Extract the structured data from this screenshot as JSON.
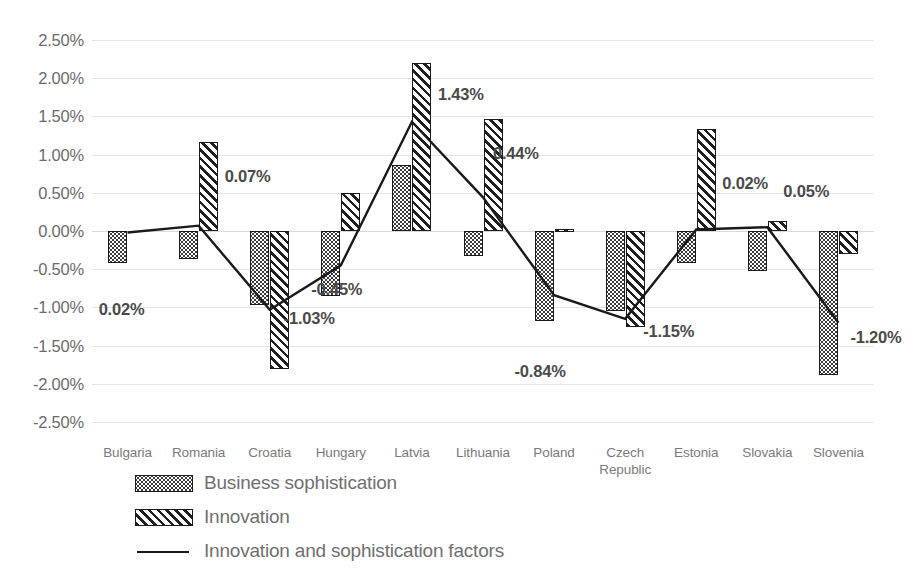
{
  "chart_data": {
    "type": "bar",
    "title": "",
    "xlabel": "",
    "ylabel": "",
    "ylim": [
      -2.5,
      2.5
    ],
    "ytick_step": 0.5,
    "grid": true,
    "legend_position": "bottom-left",
    "value_suffix": "%",
    "categories": [
      "Bulgaria",
      "Romania",
      "Croatia",
      "Hungary",
      "Latvia",
      "Lithuania",
      "Poland",
      "Czech Republic",
      "Estonia",
      "Slovakia",
      "Slovenia"
    ],
    "ytick_labels": [
      "2.50%",
      "2.00%",
      "1.50%",
      "1.00%",
      "0.50%",
      "0.00%",
      "-0.50%",
      "-1.00%",
      "-1.50%",
      "-2.00%",
      "-2.50%"
    ],
    "ytick_values": [
      2.5,
      2.0,
      1.5,
      1.0,
      0.5,
      0.0,
      -0.5,
      -1.0,
      -1.5,
      -2.0,
      -2.5
    ],
    "series": [
      {
        "name": "Business sophistication",
        "type": "bar",
        "pattern": "dotted",
        "values": [
          -0.42,
          -0.37,
          -0.97,
          -0.85,
          0.87,
          -0.33,
          -1.18,
          -1.05,
          -0.42,
          -0.52,
          -1.88
        ]
      },
      {
        "name": "Innovation",
        "type": "bar",
        "pattern": "diagonal-hatch",
        "values": [
          null,
          1.17,
          -1.8,
          0.5,
          2.2,
          1.47,
          0.03,
          -1.25,
          1.33,
          0.13,
          -0.3
        ]
      },
      {
        "name": "Innovation and sophistication factors",
        "type": "line",
        "pattern": "solid-line",
        "values": [
          -0.02,
          0.07,
          -1.03,
          -0.45,
          1.43,
          0.44,
          -0.84,
          -1.15,
          0.02,
          0.05,
          -1.2
        ],
        "point_labels": [
          "0.02%",
          "0.07%",
          "-1.03%",
          "-0.45%",
          "1.43%",
          "0.44%",
          "-0.84%",
          "-1.15%",
          "0.02%",
          "0.05%",
          "-1.20%"
        ]
      }
    ]
  },
  "legend": {
    "items": [
      {
        "label": "Business sophistication",
        "swatch": "dotted-swatch"
      },
      {
        "label": "Innovation",
        "swatch": "hatch-swatch"
      },
      {
        "label": "Innovation and sophistication factors",
        "swatch": "line-swatch"
      }
    ]
  },
  "colors": {
    "grid": "#e4e4e4",
    "bar_outline": "#1a1a1a",
    "line": "#1a1a1a",
    "label_text": "#4a4a4a",
    "axis_text": "#7a7a7a"
  }
}
